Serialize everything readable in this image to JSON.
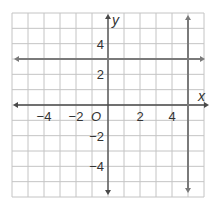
{
  "chart_data": {
    "type": "line",
    "title": "",
    "xlabel": "x",
    "ylabel": "y",
    "origin_label": "O",
    "xlim": [
      -6,
      6
    ],
    "ylim": [
      -6,
      6
    ],
    "grid": true,
    "grid_step": 1,
    "x_ticks": [
      -4,
      -2,
      2,
      4
    ],
    "x_tick_labels": [
      "−4",
      "−2",
      "2",
      "4"
    ],
    "y_ticks": [
      4,
      2,
      -2,
      -4
    ],
    "y_tick_labels": [
      "4",
      "2",
      "−2",
      "−4"
    ],
    "series": [
      {
        "name": "horizontal line y = 3",
        "kind": "horizontal",
        "y": 3,
        "x_range": [
          -6,
          6
        ],
        "arrows": "both"
      },
      {
        "name": "vertical line x = 5",
        "kind": "vertical",
        "x": 5,
        "y_range": [
          -6,
          6
        ],
        "arrows": "both"
      }
    ],
    "colors": {
      "grid": "#c4c4c4",
      "axes": "#4a4a4a",
      "lines": "#7a7a7a",
      "text": "#333333"
    }
  }
}
